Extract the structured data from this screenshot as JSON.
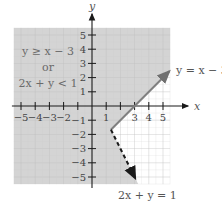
{
  "chart_data": {
    "type": "line",
    "title": "",
    "xlabel": "x",
    "ylabel": "y",
    "xlim": [
      -5.5,
      5.5
    ],
    "ylim": [
      -5.5,
      5.5
    ],
    "grid": true,
    "x_ticks": [
      -5,
      -4,
      -3,
      -2,
      -1,
      1,
      2,
      3,
      4,
      5
    ],
    "x_tick_labels_shown": [
      "-5",
      "-4",
      "-3",
      "-2",
      "1",
      "3",
      "4",
      "5"
    ],
    "y_ticks": [
      -5,
      -4,
      -3,
      -2,
      -1,
      1,
      2,
      3,
      4,
      5
    ],
    "y_tick_labels_shown": [
      "-5",
      "-4",
      "-3",
      "-2",
      "-1",
      "1",
      "2",
      "3",
      "4",
      "5"
    ],
    "shaded_region": "y >= x - 3 or 2x + y < 1",
    "region_label": [
      "y ≥ x − 3",
      "or",
      "2x + y < 1"
    ],
    "series": [
      {
        "name": "y = x − 3",
        "style": "solid",
        "points": [
          [
            1.333,
            -1.667
          ],
          [
            6,
            3
          ]
        ],
        "label": "y = x − 3"
      },
      {
        "name": "2x + y = 1",
        "style": "dashed",
        "points": [
          [
            1.333,
            -1.667
          ],
          [
            3,
            -5
          ]
        ],
        "label": "2x + y = 1"
      }
    ],
    "intersection": [
      1.333,
      -1.667
    ],
    "colors": {
      "shade": "#d4d4d4",
      "grid_shaded": "#c2c2c2",
      "grid_white": "#e2e2e2",
      "solid_line": "#808080",
      "dashed_line": "#1a1a1a",
      "axis": "#1a1a1a",
      "text": "#555555"
    }
  }
}
